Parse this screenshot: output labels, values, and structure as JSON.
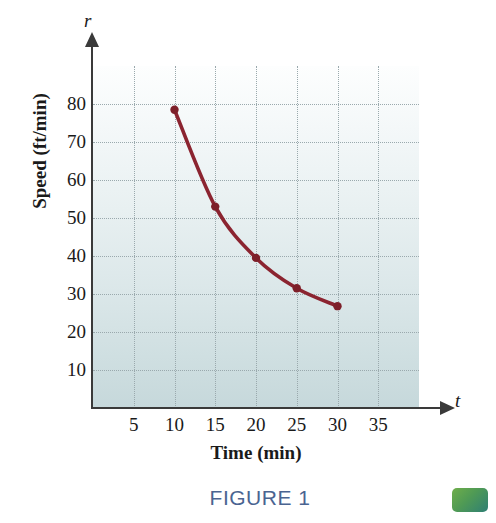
{
  "figure": {
    "caption": "FIGURE 1",
    "swatch_color": "#4f9a55"
  },
  "chart_data": {
    "type": "line",
    "title": "",
    "subtitle": "",
    "xlabel": "Time (min)",
    "ylabel": "Speed (ft/min)",
    "x_variable": "t",
    "y_variable": "r",
    "xlim": [
      0,
      40
    ],
    "ylim": [
      0,
      90
    ],
    "x_ticks": [
      5,
      10,
      15,
      20,
      25,
      30,
      35
    ],
    "x_tick_labels": [
      "5",
      "10",
      "15",
      "20",
      "25",
      "30",
      "35"
    ],
    "y_ticks": [
      10,
      20,
      30,
      40,
      50,
      60,
      70,
      80
    ],
    "y_tick_labels": [
      "10",
      "20",
      "30",
      "40",
      "50",
      "60",
      "70",
      "80"
    ],
    "grid": true,
    "grid_style": "dotted",
    "legend": "none",
    "series": [
      {
        "name": "Speed vs time",
        "color": "#8B2430",
        "marker": "circle",
        "x": [
          10,
          15,
          20,
          25,
          30
        ],
        "y": [
          78.5,
          53,
          39.5,
          31.5,
          26.8
        ]
      }
    ],
    "annotations": []
  },
  "colors": {
    "curve": "#8B2430",
    "marker": "#7d1f29",
    "axis": "#3a3a3a",
    "grid": "#9aa9ad",
    "plot_bg_top": "#fdfefe",
    "plot_bg_bottom": "#c6d8db",
    "caption": "#4a6491"
  }
}
